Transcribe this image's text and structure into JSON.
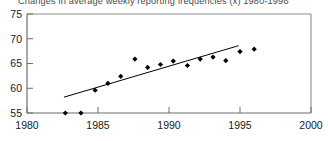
{
  "chart_data": {
    "type": "scatter",
    "title": "Changes in average weekly reporting frequencies (x) 1980-1996",
    "xlabel": "",
    "ylabel": "",
    "xlim": [
      1980,
      2000
    ],
    "ylim": [
      55,
      75
    ],
    "grid": false,
    "legend": null,
    "xticks": [
      1980,
      1985,
      1990,
      1995,
      2000
    ],
    "yticks": [
      55,
      60,
      65,
      70,
      75
    ],
    "series": [
      {
        "name": "Average weekly reporting frequency",
        "marker": "diamond",
        "color": "#000000",
        "points": [
          {
            "x": 1982.7,
            "y": 55.0
          },
          {
            "x": 1983.8,
            "y": 55.0
          },
          {
            "x": 1984.8,
            "y": 59.6
          },
          {
            "x": 1985.7,
            "y": 61.0
          },
          {
            "x": 1986.6,
            "y": 62.4
          },
          {
            "x": 1987.6,
            "y": 65.9
          },
          {
            "x": 1988.5,
            "y": 64.2
          },
          {
            "x": 1989.4,
            "y": 64.8
          },
          {
            "x": 1990.3,
            "y": 65.5
          },
          {
            "x": 1991.3,
            "y": 64.6
          },
          {
            "x": 1992.2,
            "y": 65.9
          },
          {
            "x": 1993.1,
            "y": 66.3
          },
          {
            "x": 1994.0,
            "y": 65.6
          },
          {
            "x": 1995.0,
            "y": 67.4
          },
          {
            "x": 1996.0,
            "y": 67.9
          }
        ]
      }
    ],
    "trendline": {
      "name": "Linear fit",
      "color": "#000000",
      "x_start": 1982.6,
      "y_start": 58.2,
      "x_end": 1994.9,
      "y_end": 68.6
    }
  },
  "axis": {
    "y_tick_labels": [
      "75",
      "70",
      "65",
      "60",
      "55"
    ],
    "x_tick_labels": [
      "1980",
      "1985",
      "1990",
      "1995",
      "2000"
    ]
  }
}
